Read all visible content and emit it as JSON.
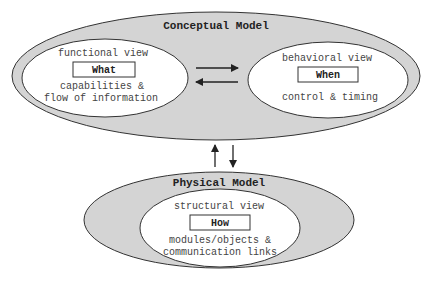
{
  "colors": {
    "outer_fill": "#d4d4d4",
    "inner_fill": "#ffffff",
    "stroke": "#333333",
    "background": "#ffffff"
  },
  "conceptual": {
    "title": "Conceptual Model",
    "functional": {
      "view": "functional view",
      "key": "What",
      "desc1": "capabilities &",
      "desc2": "flow of information"
    },
    "behavioral": {
      "view": "behavioral view",
      "key": "When",
      "desc1": "control & timing"
    }
  },
  "physical": {
    "title": "Physical Model",
    "structural": {
      "view": "structural view",
      "key": "How",
      "desc1": "modules/objects &",
      "desc2": "communication links"
    }
  },
  "arrows": {
    "horizontal": [
      "right-arrow",
      "left-arrow"
    ],
    "vertical": [
      "up-arrow",
      "down-arrow"
    ]
  }
}
